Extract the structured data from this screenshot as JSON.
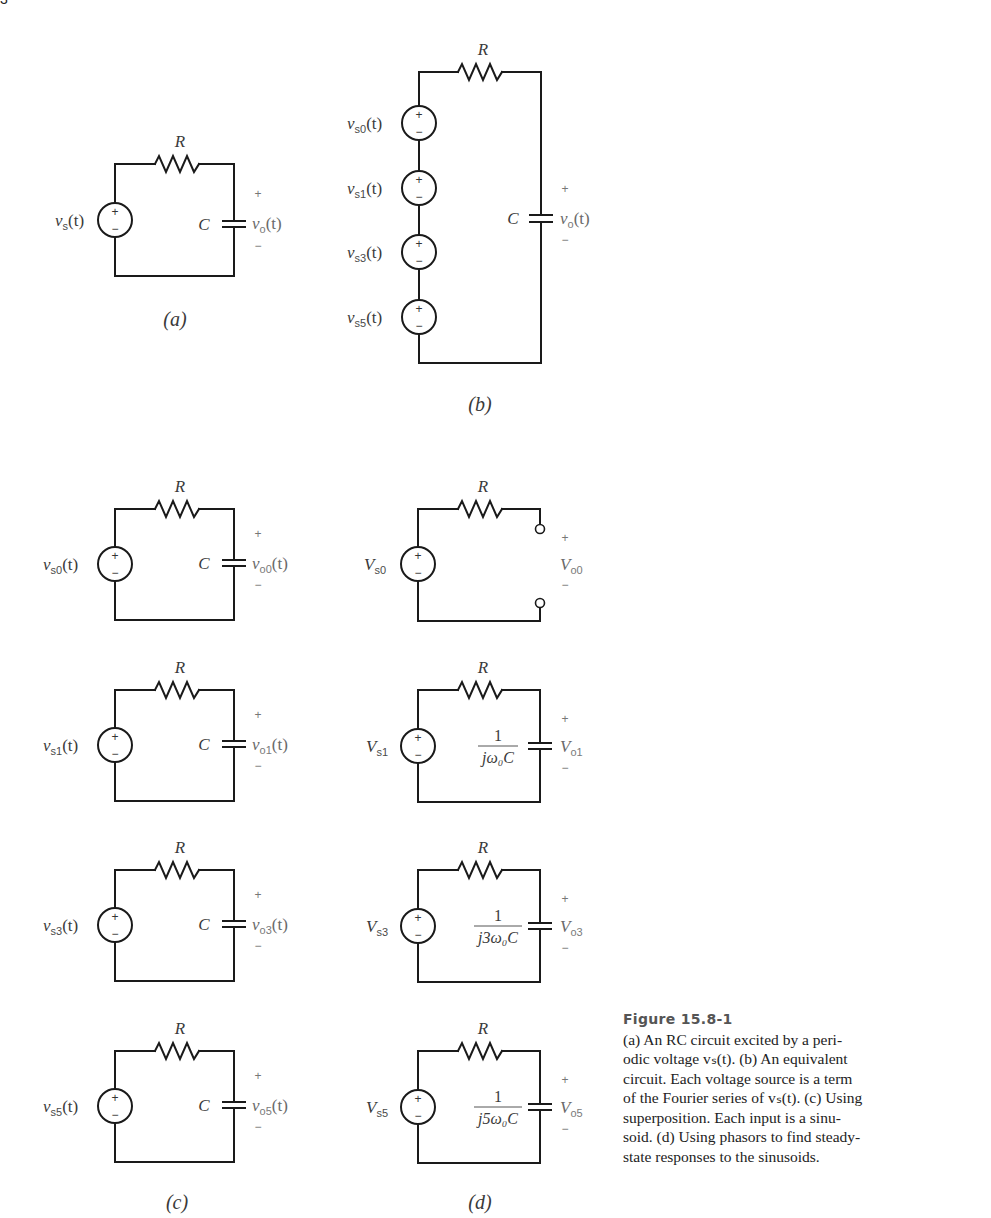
{
  "header_fragment": "3",
  "figure": {
    "title": "Figure 15.8-1",
    "caption_lines": [
      "(a) An RC circuit excited by a peri-",
      "odic voltage vₛ(t). (b) An equivalent",
      "circuit. Each voltage source is a term",
      "of the Fourier series of vₛ(t). (c) Using",
      "superposition. Each input is a sinu-",
      "soid. (d) Using phasors to find steady-",
      "state responses to the sinusoids."
    ]
  },
  "parts": {
    "a": {
      "label": "(a)",
      "resistor": "R",
      "capacitor": "C",
      "source": {
        "v": "v",
        "sub": "s",
        "arg": "(t)"
      },
      "output": {
        "v": "v",
        "sub": "o",
        "arg": "(t)"
      },
      "plus": "+",
      "minus": "−"
    },
    "b": {
      "label": "(b)",
      "resistor": "R",
      "capacitor": "C",
      "sources": [
        {
          "v": "v",
          "sub": "s0",
          "arg": "(t)"
        },
        {
          "v": "v",
          "sub": "s1",
          "arg": "(t)"
        },
        {
          "v": "v",
          "sub": "s3",
          "arg": "(t)"
        },
        {
          "v": "v",
          "sub": "s5",
          "arg": "(t)"
        }
      ],
      "output": {
        "v": "v",
        "sub": "o",
        "arg": "(t)"
      },
      "plus": "+",
      "minus": "−"
    },
    "c": {
      "label": "(c)",
      "rows": [
        {
          "resistor": "R",
          "capacitor": "C",
          "src_sub": "s0",
          "out_sub": "o0",
          "v": "v",
          "arg": "(t)"
        },
        {
          "resistor": "R",
          "capacitor": "C",
          "src_sub": "s1",
          "out_sub": "o1",
          "v": "v",
          "arg": "(t)"
        },
        {
          "resistor": "R",
          "capacitor": "C",
          "src_sub": "s3",
          "out_sub": "o3",
          "v": "v",
          "arg": "(t)"
        },
        {
          "resistor": "R",
          "capacitor": "C",
          "src_sub": "s5",
          "out_sub": "o5",
          "v": "v",
          "arg": "(t)"
        }
      ],
      "plus": "+",
      "minus": "−"
    },
    "d": {
      "label": "(d)",
      "rows": [
        {
          "resistor": "R",
          "V": "V",
          "src_sub": "s0",
          "out_sub": "o0",
          "open_circuit": true,
          "num": "",
          "den": ""
        },
        {
          "resistor": "R",
          "V": "V",
          "src_sub": "s1",
          "out_sub": "o1",
          "open_circuit": false,
          "num": "1",
          "den": "jω₀C"
        },
        {
          "resistor": "R",
          "V": "V",
          "src_sub": "s3",
          "out_sub": "o3",
          "open_circuit": false,
          "num": "1",
          "den": "j3ω₀C"
        },
        {
          "resistor": "R",
          "V": "V",
          "src_sub": "s5",
          "out_sub": "o5",
          "open_circuit": false,
          "num": "1",
          "den": "j5ω₀C"
        }
      ],
      "plus": "+",
      "minus": "−"
    }
  },
  "colors": {
    "wire": "#1a1a1a",
    "label": "#3a3a3a",
    "output_label": "#6a6a6a",
    "figure_title": "#555555"
  }
}
